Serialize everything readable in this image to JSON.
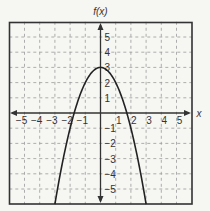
{
  "chart_data": {
    "type": "line",
    "title": "",
    "xlabel": "x",
    "ylabel": "f(x)",
    "function": "f(x) = -x^2 + 3",
    "xlim": [
      -6,
      6
    ],
    "ylim": [
      -6,
      6
    ],
    "grid": true,
    "legend": null,
    "x_ticks": [
      -5,
      -4,
      -3,
      -2,
      -1,
      1,
      2,
      3,
      4,
      5
    ],
    "y_ticks": [
      5,
      4,
      3,
      2,
      1,
      -1,
      -2,
      -3,
      -4,
      -5
    ],
    "x_tick_labels": [
      "−5",
      "−4",
      "−3",
      "−2",
      "−1",
      "1",
      "2",
      "3",
      "4",
      "5"
    ],
    "y_tick_labels": [
      "5",
      "4",
      "3",
      "2",
      "1",
      "−1",
      "−2",
      "−3",
      "−4",
      "−5"
    ],
    "series": [
      {
        "name": "f(x)",
        "x": [
          -3,
          -2.5,
          -2,
          -1.5,
          -1,
          -0.5,
          0,
          0.5,
          1,
          1.5,
          2,
          2.5,
          3
        ],
        "y": [
          -6,
          -3.25,
          -1,
          0.75,
          2,
          2.75,
          3,
          2.75,
          2,
          0.75,
          -1,
          -3.25,
          -6
        ]
      }
    ],
    "key_points": {
      "vertex": [
        0,
        3
      ],
      "x_intercepts": [
        -1.73,
        1.73
      ],
      "y_intercept": [
        0,
        3
      ]
    }
  },
  "labels": {
    "y_axis_title": "f(x)",
    "x_axis_title": "x"
  },
  "colors": {
    "background": "#f6f6f3",
    "frame": "#333333",
    "grid": "#9a9a9a",
    "curve": "#222222",
    "text": "#333333"
  }
}
